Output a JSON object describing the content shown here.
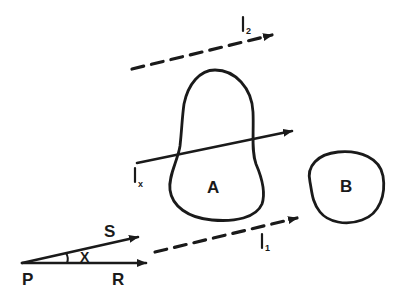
{
  "diagram": {
    "regions": [
      {
        "id": "A",
        "label": "A"
      },
      {
        "id": "B",
        "label": "B"
      }
    ],
    "lines": [
      {
        "id": "l2",
        "main": "l",
        "sub": "2",
        "style": "dashed"
      },
      {
        "id": "lx",
        "main": "l",
        "sub": "x",
        "style": "solid"
      },
      {
        "id": "l1",
        "main": "l",
        "sub": "1",
        "style": "dashed"
      }
    ],
    "angle": {
      "vertex": "P",
      "ray1": "S",
      "ray2": "R",
      "angle_label": "X"
    },
    "colors": {
      "ink": "#1a1a1a",
      "background": "#ffffff"
    }
  }
}
